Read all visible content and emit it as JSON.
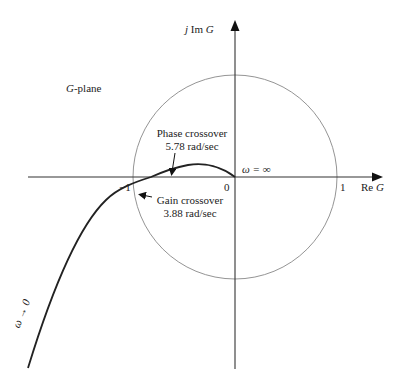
{
  "diagram": {
    "plane_label_var": "G",
    "plane_label_rest": "-plane",
    "axes": {
      "imag_prefix": "j Im",
      "imag_var": "G",
      "real_prefix": "Re",
      "real_var": "G"
    },
    "ticks": {
      "minus_one": "−1",
      "zero": "0",
      "one": "1"
    },
    "annotations": {
      "phase_crossover_title": "Phase crossover",
      "phase_crossover_value": "5.78 rad/sec",
      "gain_crossover_title": "Gain crossover",
      "gain_crossover_value": "3.88 rad/sec",
      "omega_infinity": "ω = ∞",
      "omega_zero": "ω → 0"
    },
    "unit_circle": {
      "center": [
        0,
        0
      ],
      "radius": 1
    },
    "colors": {
      "curve": "#222222",
      "axis": "#333333",
      "circle": "#888888"
    }
  }
}
